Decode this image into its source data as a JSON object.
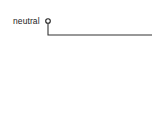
{
  "diagram": {
    "type": "wiring-diagram-fragment",
    "top_fragment_text": "",
    "terminal": {
      "label": "neutral",
      "symbol": "open-circle-terminal"
    },
    "wire": {
      "path": "down from terminal, then right to edge",
      "color": "#333333"
    }
  }
}
